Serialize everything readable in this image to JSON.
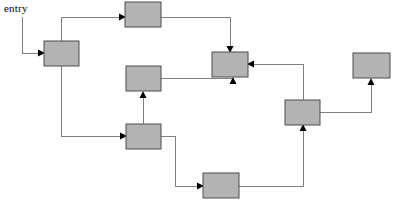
{
  "diagram": {
    "title": "entry",
    "entry_label": "entry",
    "canvas": {
      "width": 394,
      "height": 207
    },
    "style": {
      "node_fill": "#b3b3b3",
      "node_stroke": "#4d4d4d",
      "edge_color": "#808080",
      "arrow_color": "#000000",
      "background": "#ffffff"
    },
    "nodes": [
      {
        "id": "n1",
        "label": "",
        "x": 44,
        "y": 41,
        "w": 35,
        "h": 25
      },
      {
        "id": "n2",
        "label": "",
        "x": 125,
        "y": 2,
        "w": 36,
        "h": 25
      },
      {
        "id": "n3",
        "label": "",
        "x": 126,
        "y": 66,
        "w": 35,
        "h": 25
      },
      {
        "id": "n4",
        "label": "",
        "x": 126,
        "y": 124,
        "w": 35,
        "h": 25
      },
      {
        "id": "n5",
        "label": "",
        "x": 212,
        "y": 52,
        "w": 36,
        "h": 25
      },
      {
        "id": "n6",
        "label": "",
        "x": 285,
        "y": 100,
        "w": 35,
        "h": 25
      },
      {
        "id": "n7",
        "label": "",
        "x": 353,
        "y": 53,
        "w": 37,
        "h": 25
      },
      {
        "id": "n8",
        "label": "",
        "x": 203,
        "y": 173,
        "w": 36,
        "h": 25
      }
    ],
    "edges": [
      {
        "id": "e0",
        "from": "entry",
        "to": "n1",
        "path": "M 22,17 L 22,53 L 40,53"
      },
      {
        "id": "e1",
        "from": "n1",
        "to": "n2",
        "path": "M 61,41 L 61,17 L 121,17"
      },
      {
        "id": "e2",
        "from": "n1",
        "to": "n4",
        "path": "M 61,66 L 61,136 L 122,136"
      },
      {
        "id": "e3",
        "from": "n2",
        "to": "n5",
        "path": "M 161,17 L 230,17 L 230,48"
      },
      {
        "id": "e4",
        "from": "n4",
        "to": "n3",
        "path": "M 143,124 L 143,95"
      },
      {
        "id": "e5",
        "from": "n3",
        "to": "n5",
        "path": "M 161,78 L 233,78 L 233,81"
      },
      {
        "id": "e6",
        "from": "n4",
        "to": "n8",
        "path": "M 161,136 L 175,136 L 175,186 L 199,186"
      },
      {
        "id": "e7",
        "from": "n6",
        "to": "n5",
        "path": "M 303,100 L 303,64 L 252,64"
      },
      {
        "id": "e8",
        "from": "n8",
        "to": "n6",
        "path": "M 239,186 L 303,186 L 303,128"
      },
      {
        "id": "e9",
        "from": "n6",
        "to": "n7",
        "path": "M 320,112 L 371,112 L 371,82"
      }
    ]
  }
}
